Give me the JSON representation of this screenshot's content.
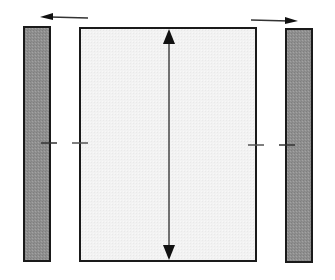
{
  "diagram": {
    "type": "schematic",
    "colors": {
      "background": "#ffffff",
      "bar_fill": "#8f8f8f",
      "panel_fill": "#f1f1f1",
      "stroke": "#1a1a1a"
    },
    "elements": {
      "left_bar": {
        "x": 23,
        "y": 26,
        "width": 27,
        "height": 235
      },
      "center_panel": {
        "x": 80,
        "y": 27,
        "width": 176,
        "height": 234
      },
      "right_bar": {
        "x": 286,
        "y": 29,
        "width": 27,
        "height": 233
      },
      "left_arrow": {
        "from": [
          88,
          18
        ],
        "to": [
          40,
          17
        ],
        "direction": "left"
      },
      "right_arrow": {
        "from": [
          251,
          20
        ],
        "to": [
          298,
          21
        ],
        "direction": "right"
      },
      "vertical_arrow": {
        "x": 169,
        "y1": 29,
        "y2": 260,
        "heads": "both"
      },
      "ticks": [
        {
          "x1": 41,
          "x2": 57,
          "y": 143
        },
        {
          "x1": 72,
          "x2": 88,
          "y": 143
        },
        {
          "x1": 248,
          "x2": 264,
          "y": 145
        },
        {
          "x1": 279,
          "x2": 295,
          "y": 145
        }
      ]
    },
    "labels": []
  }
}
